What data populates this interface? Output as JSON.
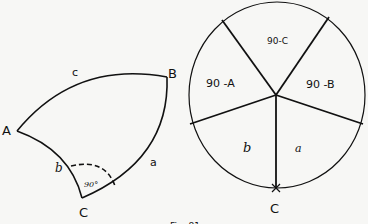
{
  "triangle": {
    "vertices": {
      "A": "A",
      "B": "B",
      "C": "C"
    },
    "sides": {
      "a": "a",
      "b": "b",
      "c": "c"
    },
    "right_angle_label": "90°"
  },
  "napier_circle": {
    "segments": {
      "top": "90-C",
      "left": "90 -A",
      "right": "90 -B",
      "bottom_left": "b",
      "bottom_right": "a"
    },
    "bottom_label": "C"
  },
  "caption": "Fig. 81"
}
